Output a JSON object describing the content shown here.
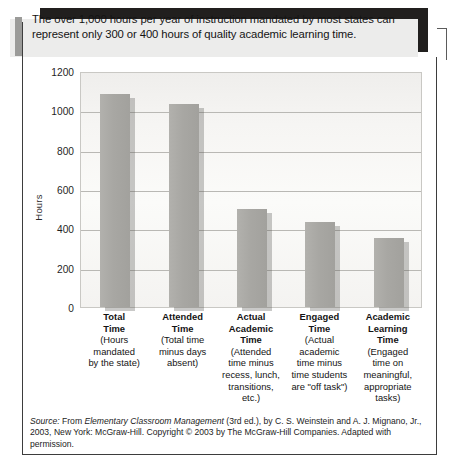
{
  "caption": {
    "text": "The over 1,000 hours per year of instruction mandated by most states can represent only 300 or 400 hours of quality academic learning time."
  },
  "source_note": {
    "label": "Source:",
    "prefix": " From ",
    "title": "Elementary Classroom Management",
    "rest": " (3rd ed.), by C. S. Weinstein and A. J. Mignano, Jr., 2003, New York: McGraw-Hill. Copyright © 2003 by The McGraw-Hill Companies. Adapted with permission."
  },
  "chart_data": {
    "type": "bar",
    "title": "",
    "xlabel": "",
    "ylabel": "Hours",
    "ylim": [
      0,
      1200
    ],
    "yticks": [
      0,
      200,
      400,
      600,
      800,
      1000,
      1200
    ],
    "ytick_labels": [
      "0",
      "200",
      "400",
      "600",
      "800",
      "1000",
      "1200"
    ],
    "grid": true,
    "legend": "none",
    "bar_color": "#a8a7a3",
    "plot_background": "#f6f5f3",
    "categories": [
      "Total Time",
      "Attended Time",
      "Actual Academic Time",
      "Engaged Time",
      "Academic Learning Time"
    ],
    "values": [
      1085,
      1030,
      500,
      430,
      350
    ],
    "category_labels": [
      {
        "title_lines": [
          "Total",
          "Time"
        ],
        "sub_lines": [
          "(Hours",
          "mandated",
          "by the state)"
        ]
      },
      {
        "title_lines": [
          "Attended",
          "Time"
        ],
        "sub_lines": [
          "(Total time",
          "minus days",
          "absent)"
        ]
      },
      {
        "title_lines": [
          "Actual",
          "Academic",
          "Time"
        ],
        "sub_lines": [
          "(Attended",
          "time minus",
          "recess, lunch,",
          "transitions,",
          "etc.)"
        ]
      },
      {
        "title_lines": [
          "Engaged",
          "Time"
        ],
        "sub_lines": [
          "(Actual",
          "academic",
          "time minus",
          "time students",
          "are \"off task\")"
        ]
      },
      {
        "title_lines": [
          "Academic",
          "Learning",
          "Time"
        ],
        "sub_lines": [
          "(Engaged",
          "time on",
          "meaningful,",
          "appropriate",
          "tasks)"
        ]
      }
    ]
  }
}
